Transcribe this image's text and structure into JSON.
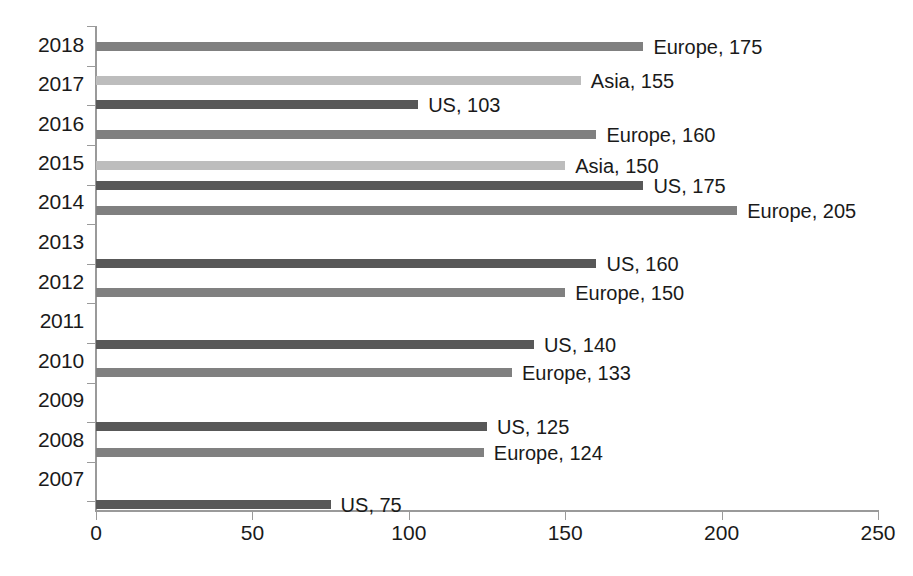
{
  "chart_data": {
    "type": "bar",
    "orientation": "horizontal",
    "title": "",
    "subtitle": "",
    "xlabel": "",
    "ylabel": "",
    "xlim": [
      0,
      250
    ],
    "xticks": [
      0,
      50,
      100,
      150,
      200,
      250
    ],
    "xticklabels": [
      "0",
      "50",
      "100",
      "150",
      "200",
      "250"
    ],
    "categories": [
      "2018",
      "2017",
      "2016",
      "2015",
      "2014",
      "2013",
      "2012",
      "2011",
      "2010",
      "2009",
      "2008",
      "2007"
    ],
    "grid": false,
    "legend": "none",
    "series_colors": {
      "Europe": "#808080",
      "Asia": "#bdbdbd",
      "US": "#585858"
    },
    "bars": [
      {
        "category": "2018",
        "region": "Europe",
        "value": 175,
        "label": "Europe, 175",
        "color": "#808080"
      },
      {
        "category": "2017",
        "region": "Asia",
        "value": 155,
        "label": "Asia, 155",
        "color": "#bdbdbd"
      },
      {
        "category": "2017",
        "region": "US",
        "value": 103,
        "label": "US, 103",
        "color": "#585858"
      },
      {
        "category": "2016",
        "region": "Europe",
        "value": 160,
        "label": "Europe, 160",
        "color": "#808080"
      },
      {
        "category": "2015",
        "region": "Asia",
        "value": 150,
        "label": "Asia, 150",
        "color": "#bdbdbd"
      },
      {
        "category": "2015",
        "region": "US",
        "value": 175,
        "label": "US, 175",
        "color": "#585858"
      },
      {
        "category": "2014",
        "region": "Europe",
        "value": 205,
        "label": "Europe, 205",
        "color": "#808080"
      },
      {
        "category": "2013",
        "region": "US",
        "value": 160,
        "label": "US, 160",
        "color": "#585858"
      },
      {
        "category": "2012",
        "region": "Europe",
        "value": 150,
        "label": "Europe, 150",
        "color": "#808080"
      },
      {
        "category": "2011",
        "region": "US",
        "value": 140,
        "label": "US, 140",
        "color": "#585858"
      },
      {
        "category": "2010",
        "region": "Europe",
        "value": 133,
        "label": "Europe, 133",
        "color": "#808080"
      },
      {
        "category": "2009",
        "region": "US",
        "value": 125,
        "label": "US, 125",
        "color": "#585858"
      },
      {
        "category": "2008",
        "region": "Europe",
        "value": 124,
        "label": "Europe, 124",
        "color": "#808080"
      },
      {
        "category": "2007",
        "region": "US",
        "value": 75,
        "label": "US, 75",
        "color": "#585858"
      }
    ]
  },
  "layout": {
    "plot_left_px": 96,
    "plot_width_px": 782,
    "bar_rows": [
      {
        "y": 42,
        "bar_index": 0
      },
      {
        "y": 76,
        "bar_index": 1
      },
      {
        "y": 100,
        "bar_index": 2
      },
      {
        "y": 130,
        "bar_index": 3
      },
      {
        "y": 161,
        "bar_index": 4
      },
      {
        "y": 181,
        "bar_index": 5
      },
      {
        "y": 206,
        "bar_index": 6
      },
      {
        "y": 259,
        "bar_index": 7
      },
      {
        "y": 288,
        "bar_index": 8
      },
      {
        "y": 340,
        "bar_index": 9
      },
      {
        "y": 368,
        "bar_index": 10
      },
      {
        "y": 422,
        "bar_index": 11
      },
      {
        "y": 448,
        "bar_index": 12
      },
      {
        "y": 500,
        "bar_index": 13
      }
    ],
    "ylabel_rows": [
      {
        "text": "2018",
        "y": 46
      },
      {
        "text": "2017",
        "y": 85
      },
      {
        "text": "2016",
        "y": 125
      },
      {
        "text": "2015",
        "y": 164
      },
      {
        "text": "2014",
        "y": 203
      },
      {
        "text": "2013",
        "y": 243
      },
      {
        "text": "2012",
        "y": 283
      },
      {
        "text": "2011",
        "y": 322
      },
      {
        "text": "2010",
        "y": 362
      },
      {
        "text": "2009",
        "y": 401
      },
      {
        "text": "2008",
        "y": 441
      },
      {
        "text": "2007",
        "y": 480
      }
    ],
    "ytick_positions": [
      26,
      66,
      105,
      145,
      185,
      224,
      264,
      303,
      343,
      383,
      422,
      462,
      501
    ],
    "xtick_values": [
      0,
      50,
      100,
      150,
      200,
      250
    ]
  }
}
